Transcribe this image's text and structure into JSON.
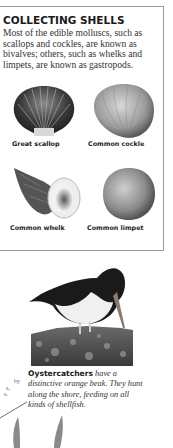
{
  "panel": {
    "title": "COLLECTING SHELLS",
    "intro": "Most of the edible molluscs, such as scallops and cockles, are known as bivalves; others, such as whelks and limpets, are known as gastropods.",
    "shells": [
      {
        "name": "Great scallop",
        "icon": "scallop-shell-image"
      },
      {
        "name": "Common cockle",
        "icon": "cockle-shell-image"
      },
      {
        "name": "Common whelk",
        "icon": "whelk-shell-image"
      },
      {
        "name": "Common limpet",
        "icon": "limpet-shell-image"
      }
    ]
  },
  "photo": {
    "subject": "oystercatcher-image",
    "caption_bold": "Oystercatchers",
    "caption_rest": " have a distinctive orange beak. They hunt along the shore, feeding on all kinds of shellfish."
  },
  "left_fragment": {
    "lines": [
      "by",
      "s,",
      "s."
    ]
  }
}
